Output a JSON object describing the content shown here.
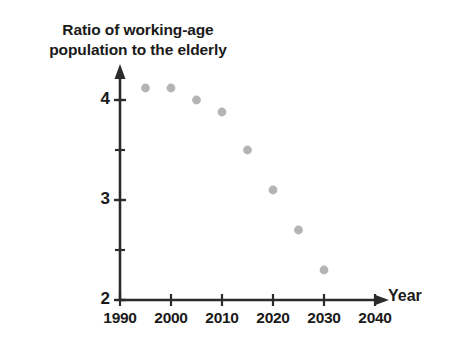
{
  "chart_data": {
    "type": "scatter",
    "title": "Ratio of working-age population to the elderly",
    "title_lines": [
      "Ratio of working-age",
      "population to the elderly"
    ],
    "xlabel": "Year",
    "ylabel": "",
    "xlim": [
      1990,
      2042
    ],
    "ylim": [
      2,
      4.25
    ],
    "grid": false,
    "legend": null,
    "x_ticks": [
      1990,
      2000,
      2010,
      2020,
      2030,
      2040
    ],
    "x_tick_labels": [
      "1990",
      "2000",
      "2010",
      "2020",
      "2030",
      "2040"
    ],
    "x_minor_tick_interval": 10,
    "y_ticks": [
      2,
      3,
      4
    ],
    "y_tick_labels": [
      "2",
      "3",
      "4"
    ],
    "y_minor_ticks": [
      2.5,
      3.5
    ],
    "marker_color": "#b4b4b4",
    "axis_color": "#2b2b2b",
    "x": [
      1995,
      2000,
      2005,
      2010,
      2015,
      2020,
      2025,
      2030
    ],
    "values": [
      4.12,
      4.12,
      4.0,
      3.88,
      3.5,
      3.1,
      2.7,
      2.3
    ],
    "points": [
      {
        "year": 1995,
        "ratio": 4.12
      },
      {
        "year": 2000,
        "ratio": 4.12
      },
      {
        "year": 2005,
        "ratio": 4.0
      },
      {
        "year": 2010,
        "ratio": 3.88
      },
      {
        "year": 2015,
        "ratio": 3.5
      },
      {
        "year": 2020,
        "ratio": 3.1
      },
      {
        "year": 2025,
        "ratio": 2.7
      },
      {
        "year": 2030,
        "ratio": 2.3
      }
    ]
  }
}
